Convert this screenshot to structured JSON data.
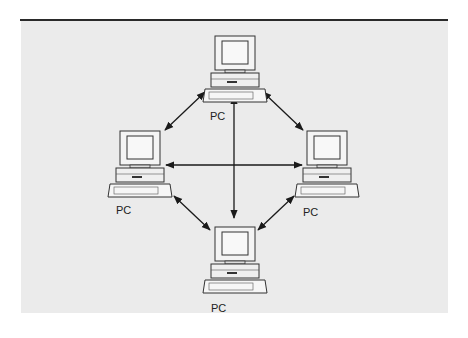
{
  "diagram": {
    "type": "peer-to-peer network",
    "nodes": [
      {
        "id": "top",
        "label": "PC"
      },
      {
        "id": "left",
        "label": "PC"
      },
      {
        "id": "right",
        "label": "PC"
      },
      {
        "id": "bottom",
        "label": "PC"
      }
    ],
    "edges": [
      {
        "from": "top",
        "to": "left",
        "bidirectional": true
      },
      {
        "from": "top",
        "to": "right",
        "bidirectional": true
      },
      {
        "from": "top",
        "to": "bottom",
        "bidirectional": true
      },
      {
        "from": "left",
        "to": "right",
        "bidirectional": true
      },
      {
        "from": "left",
        "to": "bottom",
        "bidirectional": true
      },
      {
        "from": "right",
        "to": "bottom",
        "bidirectional": true
      }
    ],
    "colors": {
      "background": "#ebebeb",
      "line": "#1a1a1a"
    }
  }
}
